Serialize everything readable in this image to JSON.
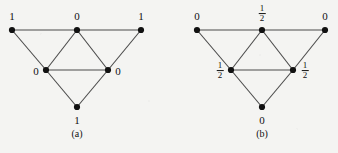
{
  "figure": {
    "background_color": "#f4f4f2",
    "ink_color": "#111111",
    "edge_color": "#4a4a4a",
    "width": 338,
    "height": 153,
    "panels": [
      {
        "id": "a",
        "caption": "(a)",
        "caption_pos": {
          "x": 77,
          "y": 134
        },
        "vertices": [
          {
            "id": "a-top-left",
            "x": 12,
            "y": 30,
            "label": "1",
            "label_type": "integer",
            "label_pos": {
              "x": 12,
              "y": 16
            }
          },
          {
            "id": "a-top-mid",
            "x": 77,
            "y": 30,
            "label": "0",
            "label_type": "integer",
            "label_pos": {
              "x": 77,
              "y": 16
            }
          },
          {
            "id": "a-top-right",
            "x": 141,
            "y": 30,
            "label": "1",
            "label_type": "integer",
            "label_pos": {
              "x": 141,
              "y": 16
            }
          },
          {
            "id": "a-mid-left",
            "x": 46,
            "y": 70,
            "label": "0",
            "label_type": "integer",
            "label_pos": {
              "x": 36,
              "y": 71
            }
          },
          {
            "id": "a-mid-right",
            "x": 108,
            "y": 70,
            "label": "0",
            "label_type": "integer",
            "label_pos": {
              "x": 118,
              "y": 71
            }
          },
          {
            "id": "a-bottom",
            "x": 77,
            "y": 107,
            "label": "1",
            "label_type": "integer",
            "label_pos": {
              "x": 77,
              "y": 120
            }
          }
        ],
        "edges": [
          {
            "from": "a-top-left",
            "to": "a-top-mid"
          },
          {
            "from": "a-top-mid",
            "to": "a-top-right"
          },
          {
            "from": "a-top-left",
            "to": "a-mid-left"
          },
          {
            "from": "a-top-mid",
            "to": "a-mid-left"
          },
          {
            "from": "a-top-mid",
            "to": "a-mid-right"
          },
          {
            "from": "a-top-right",
            "to": "a-mid-right"
          },
          {
            "from": "a-mid-left",
            "to": "a-mid-right"
          },
          {
            "from": "a-mid-left",
            "to": "a-bottom"
          },
          {
            "from": "a-mid-right",
            "to": "a-bottom"
          }
        ]
      },
      {
        "id": "b",
        "caption": "(b)",
        "caption_pos": {
          "x": 262,
          "y": 134
        },
        "vertices": [
          {
            "id": "b-top-left",
            "x": 197,
            "y": 30,
            "label": "0",
            "label_type": "integer",
            "label_pos": {
              "x": 197,
              "y": 16
            }
          },
          {
            "id": "b-top-mid",
            "x": 262,
            "y": 30,
            "label": "1/2",
            "label_type": "fraction",
            "numerator": "1",
            "denominator": "2",
            "label_pos": {
              "x": 262,
              "y": 14
            }
          },
          {
            "id": "b-top-right",
            "x": 325,
            "y": 30,
            "label": "0",
            "label_type": "integer",
            "label_pos": {
              "x": 325,
              "y": 16
            }
          },
          {
            "id": "b-mid-left",
            "x": 231,
            "y": 70,
            "label": "1/2",
            "label_type": "fraction",
            "numerator": "1",
            "denominator": "2",
            "label_pos": {
              "x": 220,
              "y": 71
            }
          },
          {
            "id": "b-mid-right",
            "x": 293,
            "y": 70,
            "label": "1/2",
            "label_type": "fraction",
            "numerator": "1",
            "denominator": "2",
            "label_pos": {
              "x": 305,
              "y": 71
            }
          },
          {
            "id": "b-bottom",
            "x": 262,
            "y": 107,
            "label": "0",
            "label_type": "integer",
            "label_pos": {
              "x": 262,
              "y": 120
            }
          }
        ],
        "edges": [
          {
            "from": "b-top-left",
            "to": "b-top-mid"
          },
          {
            "from": "b-top-mid",
            "to": "b-top-right"
          },
          {
            "from": "b-top-left",
            "to": "b-mid-left"
          },
          {
            "from": "b-top-mid",
            "to": "b-mid-left"
          },
          {
            "from": "b-top-mid",
            "to": "b-mid-right"
          },
          {
            "from": "b-top-right",
            "to": "b-mid-right"
          },
          {
            "from": "b-mid-left",
            "to": "b-mid-right"
          },
          {
            "from": "b-mid-left",
            "to": "b-bottom"
          },
          {
            "from": "b-mid-right",
            "to": "b-bottom"
          }
        ]
      }
    ]
  }
}
